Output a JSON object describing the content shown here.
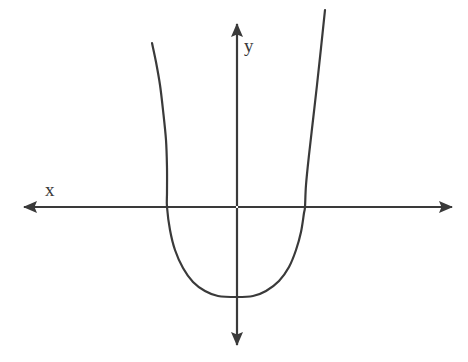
{
  "figure": {
    "title": "",
    "background_color": "#ffffff",
    "stroke_color": "#3a3a3a",
    "width": 468,
    "height": 362
  },
  "labels": {
    "x_axis": "x",
    "y_axis": "y"
  },
  "chart_data": {
    "type": "line",
    "title": "",
    "subtitle": "",
    "xlabel": "x",
    "ylabel": "y",
    "grid": false,
    "legend": null,
    "axes": {
      "x_axis": {
        "label": "x",
        "orientation": "horizontal",
        "arrowheads": "both",
        "ticks": [],
        "tick_labels": [],
        "pixel_y": 207,
        "pixel_x_start": 14,
        "pixel_x_end": 462
      },
      "y_axis": {
        "label": "y",
        "orientation": "vertical",
        "arrowheads": "both",
        "ticks": [],
        "tick_labels": [],
        "pixel_x": 237,
        "pixel_y_start": 14,
        "pixel_y_end": 355
      }
    },
    "series": [
      {
        "name": "parabola",
        "shape": "parabola",
        "opening": "upward",
        "vertex": {
          "x": 0,
          "y": -1
        },
        "x_intercepts": [
          -1.15,
          1.15
        ],
        "y_intercept": -1,
        "equation": "y = a*x^2 - 1",
        "x": [
          -1.45,
          -1.3,
          -1.15,
          -1.0,
          -0.85,
          -0.7,
          -0.55,
          -0.4,
          -0.25,
          0,
          0.25,
          0.4,
          0.55,
          0.7,
          0.85,
          1.0,
          1.15,
          1.3,
          1.45,
          1.58
        ],
        "y": [
          0.9,
          0.32,
          0.0,
          -0.25,
          -0.45,
          -0.63,
          -0.77,
          -0.88,
          -0.96,
          -1.0,
          -0.96,
          -0.88,
          -0.77,
          -0.63,
          -0.45,
          -0.25,
          0.0,
          0.32,
          0.9,
          1.42
        ],
        "pixel_points": [
          [
            152,
            43
          ],
          [
            156,
            62
          ],
          [
            160,
            85
          ],
          [
            163,
            110
          ],
          [
            166,
            140
          ],
          [
            167,
            168
          ],
          [
            167,
            192
          ],
          [
            167,
            207
          ],
          [
            170,
            230
          ],
          [
            175,
            250
          ],
          [
            183,
            268
          ],
          [
            193,
            282
          ],
          [
            205,
            291
          ],
          [
            218,
            296
          ],
          [
            237,
            297
          ],
          [
            253,
            296
          ],
          [
            266,
            291
          ],
          [
            279,
            281
          ],
          [
            289,
            267
          ],
          [
            296,
            250
          ],
          [
            301,
            232
          ],
          [
            304,
            213
          ],
          [
            305,
            207
          ],
          [
            306,
            185
          ],
          [
            309,
            155
          ],
          [
            313,
            120
          ],
          [
            317,
            85
          ],
          [
            321,
            48
          ],
          [
            325,
            10
          ]
        ]
      }
    ]
  }
}
